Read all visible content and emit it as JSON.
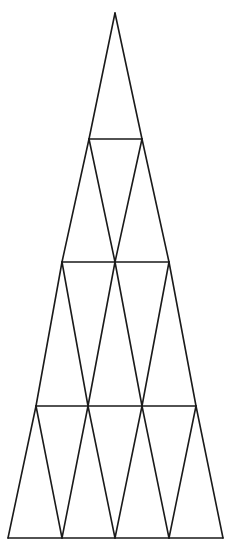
{
  "diagram": {
    "type": "triangular-lattice-figure",
    "stroke_color": "#1a1a1a",
    "background_color": "#ffffff",
    "stroke_width": 1.6,
    "apex": [
      115,
      13
    ],
    "rows": [
      {
        "y": 139,
        "xs": [
          89,
          142
        ]
      },
      {
        "y": 262,
        "xs": [
          62,
          115,
          169
        ]
      },
      {
        "y": 406,
        "xs": [
          36,
          88,
          142,
          196
        ]
      },
      {
        "y": 538,
        "xs": [
          8,
          62,
          115,
          169,
          223
        ]
      }
    ],
    "triangle_count_per_row": [
      1,
      3,
      5,
      7
    ]
  }
}
